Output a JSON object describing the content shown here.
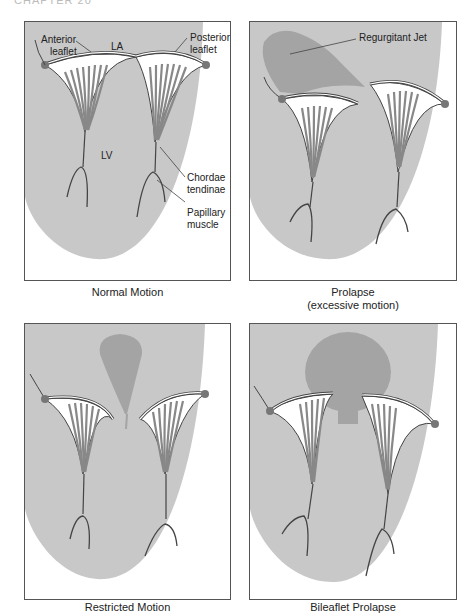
{
  "header": {
    "chapter": "CHAPTER 20"
  },
  "colors": {
    "ventricle_fill": "#c8c8c8",
    "jet_fill": "#a4a4a4",
    "leaflet_fill": "#ffffff",
    "outline": "#444444",
    "annulus_dot": "#777777",
    "panel_border": "#555555"
  },
  "panels": [
    {
      "id": "normal",
      "caption": "Normal Motion",
      "labels": {
        "anterior": "Anterior leaflet",
        "anterior_l1": "Anterior",
        "anterior_l2": "leaflet",
        "la": "LA",
        "posterior_l1": "Posterior",
        "posterior_l2": "leaflet",
        "lv": "LV",
        "chordae_l1": "Chordae",
        "chordae_l2": "tendinae",
        "papillary_l1": "Papillary",
        "papillary_l2": "muscle"
      }
    },
    {
      "id": "prolapse",
      "caption_l1": "Prolapse",
      "caption_l2": "(excessive motion)",
      "labels": {
        "jet": "Regurgitant Jet"
      }
    },
    {
      "id": "restricted",
      "caption": "Restricted Motion"
    },
    {
      "id": "bileaflet",
      "caption": "Bileaflet Prolapse"
    }
  ]
}
